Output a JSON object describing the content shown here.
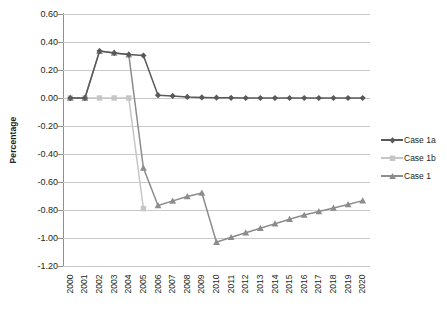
{
  "chart_data": {
    "type": "line",
    "title": "",
    "xlabel": "",
    "ylabel": "Percentage",
    "ylim": [
      -1.2,
      0.6
    ],
    "ytick_step": 0.2,
    "grid": true,
    "legend_position": "right",
    "y_ticks": [
      "0.60",
      "0.40",
      "0.20",
      "0.00",
      "-0.20",
      "-0.40",
      "-0.60",
      "-0.80",
      "-1.00",
      "-1.20"
    ],
    "y_tick_values": [
      0.6,
      0.4,
      0.2,
      0.0,
      -0.2,
      -0.4,
      -0.6,
      -0.8,
      -1.0,
      -1.2
    ],
    "categories": [
      "2000",
      "2001",
      "2002",
      "2003",
      "2004",
      "2005",
      "2006",
      "2007",
      "2008",
      "2009",
      "2010",
      "2011",
      "2012",
      "2013",
      "2014",
      "2015",
      "2016",
      "2017",
      "2018",
      "2019",
      "2020"
    ],
    "series": [
      {
        "name": "Case 1a",
        "color": "#595959",
        "marker": "diamond",
        "values": [
          0.0,
          0.0,
          0.335,
          0.322,
          0.31,
          0.303,
          0.02,
          0.015,
          0.008,
          0.004,
          0.002,
          0.001,
          0.0,
          0.0,
          0.0,
          0.0,
          0.0,
          0.0,
          0.0,
          0.0,
          0.0
        ]
      },
      {
        "name": "Case 1b",
        "color": "#c6c6c6",
        "marker": "square",
        "values": [
          0.0,
          0.0,
          0.0,
          0.0,
          0.0,
          -0.79,
          null,
          null,
          null,
          null,
          null,
          null,
          null,
          null,
          null,
          null,
          null,
          null,
          null,
          null,
          null
        ]
      },
      {
        "name": "Case 1",
        "color": "#8c8c8c",
        "marker": "triangle",
        "values": [
          0.0,
          0.0,
          0.335,
          0.322,
          0.31,
          -0.5,
          -0.768,
          -0.735,
          -0.703,
          -0.678,
          -1.03,
          -0.995,
          -0.962,
          -0.93,
          -0.898,
          -0.866,
          -0.836,
          -0.81,
          -0.785,
          -0.76,
          -0.733
        ]
      }
    ]
  },
  "legend": {
    "items": [
      {
        "label": "Case 1a"
      },
      {
        "label": "Case 1b"
      },
      {
        "label": "Case 1"
      }
    ]
  },
  "axes": {
    "y_title": "Percentage"
  },
  "colors": {
    "case_1a": "#595959",
    "case_1b": "#c6c6c6",
    "case_1": "#8c8c8c",
    "gridline": "#c9c9c9",
    "axis": "#8f8f8f",
    "text": "#231f20",
    "background": "#ffffff"
  }
}
